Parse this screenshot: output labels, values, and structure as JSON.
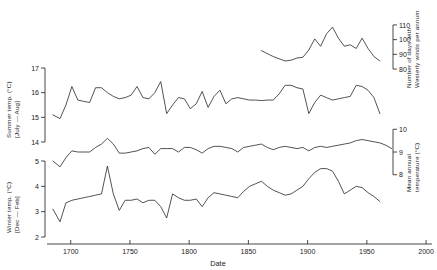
{
  "figure": {
    "background_color": "#ffffff",
    "line_color": "#1a1a1a"
  },
  "x_axis": {
    "title": "Date",
    "ticks": [
      1700,
      1750,
      1800,
      1850,
      1900,
      1950,
      2000
    ],
    "tick_labels": [
      "1700",
      "1750",
      "1800",
      "1850",
      "1900",
      "1950",
      "2000"
    ],
    "range": [
      1680,
      2005
    ]
  },
  "panels": {
    "winds": {
      "title_line1": "Number of days with",
      "title_line2": "Westerly winds per annum",
      "side": "right",
      "ticks": [
        80,
        90,
        100,
        110
      ],
      "tick_labels": [
        "80",
        "90",
        "100",
        "110"
      ],
      "range": [
        78,
        112
      ]
    },
    "summer": {
      "title_line1": "Summer temp. (°C)",
      "title_line2": "[July — Aug]",
      "side": "left",
      "ticks": [
        14,
        15,
        16,
        17
      ],
      "tick_labels": [
        "14",
        "15",
        "16",
        "17"
      ],
      "range": [
        14,
        17
      ]
    },
    "mean_annual": {
      "title_line1": "Mean annual",
      "title_line2": "temperature (°C)",
      "side": "right",
      "ticks": [
        8,
        9,
        10
      ],
      "tick_labels": [
        "8",
        "9",
        "10"
      ],
      "range": [
        7.9,
        10.1
      ]
    },
    "winter": {
      "title_line1": "Winter temp. (°C)",
      "title_line2": "[Dec — Feb]",
      "side": "left",
      "ticks": [
        2,
        3,
        4,
        5
      ],
      "tick_labels": [
        "2",
        "3",
        "4",
        "5"
      ],
      "range": [
        2,
        5
      ]
    }
  },
  "chart_data": {
    "type": "line",
    "title": "",
    "xlabel": "Date",
    "ylabel": "",
    "grid": false,
    "legend": "none",
    "xlim": [
      1680,
      2005
    ],
    "series": [
      {
        "name": "Number of days with Westerly winds per annum",
        "axis": "right-top",
        "ylim": [
          78,
          112
        ],
        "units": "days",
        "x": [
          1861,
          1871,
          1881,
          1886,
          1891,
          1896,
          1901,
          1906,
          1911,
          1916,
          1921,
          1926,
          1931,
          1936,
          1941,
          1946,
          1951,
          1956,
          1961
        ],
        "values": [
          92.5,
          88.5,
          85.5,
          86.0,
          87.5,
          88.0,
          93.0,
          100.5,
          95.5,
          104.0,
          108.5,
          101.0,
          95.5,
          96.5,
          94.0,
          101.0,
          94.0,
          88.5,
          85.5
        ]
      },
      {
        "name": "Summer temp. (July — Aug)",
        "axis": "left-top",
        "ylim": [
          14,
          17
        ],
        "units": "°C",
        "x": [
          1685,
          1691,
          1696,
          1701,
          1706,
          1711,
          1716,
          1721,
          1726,
          1731,
          1736,
          1741,
          1746,
          1751,
          1756,
          1761,
          1766,
          1771,
          1776,
          1781,
          1786,
          1791,
          1796,
          1801,
          1806,
          1811,
          1816,
          1821,
          1826,
          1831,
          1836,
          1841,
          1846,
          1851,
          1856,
          1861,
          1866,
          1871,
          1876,
          1881,
          1886,
          1891,
          1896,
          1901,
          1906,
          1911,
          1916,
          1921,
          1926,
          1931,
          1936,
          1941,
          1946,
          1951,
          1956,
          1961
        ],
        "values": [
          15.1,
          14.95,
          15.5,
          16.25,
          15.7,
          15.65,
          15.6,
          16.2,
          16.2,
          16.0,
          15.85,
          15.75,
          15.8,
          15.9,
          16.25,
          15.8,
          15.75,
          16.0,
          16.45,
          15.15,
          15.5,
          15.8,
          15.75,
          15.35,
          15.55,
          16.05,
          15.4,
          15.85,
          16.1,
          15.55,
          15.75,
          15.8,
          15.75,
          15.7,
          15.7,
          15.68,
          15.7,
          15.7,
          15.95,
          16.3,
          16.3,
          16.2,
          16.15,
          15.15,
          15.6,
          15.9,
          15.8,
          15.7,
          15.75,
          15.8,
          15.85,
          16.3,
          16.25,
          16.1,
          15.8,
          15.15
        ]
      },
      {
        "name": "Mean annual temperature",
        "axis": "right-mid",
        "ylim": [
          7.9,
          10.1
        ],
        "units": "°C",
        "x": [
          1685,
          1691,
          1696,
          1701,
          1706,
          1711,
          1716,
          1721,
          1726,
          1731,
          1736,
          1741,
          1746,
          1751,
          1756,
          1761,
          1766,
          1771,
          1776,
          1781,
          1786,
          1791,
          1796,
          1801,
          1806,
          1811,
          1816,
          1821,
          1826,
          1831,
          1836,
          1841,
          1846,
          1851,
          1856,
          1861,
          1866,
          1871,
          1876,
          1881,
          1886,
          1891,
          1896,
          1901,
          1906,
          1911,
          1916,
          1921,
          1926,
          1931,
          1936,
          1941,
          1946,
          1951,
          1956,
          1961,
          1966,
          1971
        ],
        "values": [
          8.6,
          8.35,
          8.75,
          9.05,
          9.0,
          9.0,
          9.0,
          9.2,
          9.35,
          9.6,
          9.35,
          8.95,
          8.95,
          9.0,
          9.05,
          9.15,
          9.2,
          8.9,
          9.15,
          9.15,
          9.15,
          9.0,
          9.2,
          9.2,
          9.1,
          8.95,
          9.15,
          9.25,
          9.25,
          9.2,
          9.15,
          9.0,
          9.2,
          9.25,
          9.3,
          9.35,
          9.2,
          9.1,
          9.2,
          9.25,
          9.2,
          9.15,
          9.2,
          9.05,
          9.2,
          9.25,
          9.2,
          9.25,
          9.3,
          9.35,
          9.4,
          9.5,
          9.55,
          9.5,
          9.45,
          9.4,
          9.3,
          9.15
        ]
      },
      {
        "name": "Winter temp. (Dec — Feb)",
        "axis": "left-bottom",
        "ylim": [
          2,
          5
        ],
        "units": "°C",
        "x": [
          1685,
          1691,
          1696,
          1701,
          1706,
          1711,
          1716,
          1721,
          1726,
          1731,
          1736,
          1741,
          1746,
          1751,
          1756,
          1761,
          1766,
          1771,
          1776,
          1781,
          1786,
          1791,
          1796,
          1801,
          1806,
          1811,
          1816,
          1821,
          1826,
          1831,
          1836,
          1841,
          1846,
          1851,
          1856,
          1861,
          1866,
          1871,
          1876,
          1881,
          1886,
          1891,
          1896,
          1901,
          1906,
          1911,
          1916,
          1921,
          1926,
          1931,
          1936,
          1941,
          1946,
          1951,
          1956,
          1961
        ],
        "values": [
          3.1,
          2.6,
          3.35,
          3.45,
          3.5,
          3.55,
          3.6,
          3.65,
          3.7,
          4.8,
          3.7,
          3.05,
          3.45,
          3.45,
          3.5,
          3.35,
          3.45,
          3.45,
          3.2,
          2.75,
          3.7,
          3.55,
          3.45,
          3.45,
          3.5,
          3.2,
          3.55,
          3.75,
          3.7,
          3.65,
          3.6,
          3.55,
          3.8,
          4.0,
          4.1,
          4.2,
          4.0,
          3.85,
          3.75,
          3.65,
          3.7,
          3.85,
          4.0,
          4.3,
          4.55,
          4.7,
          4.7,
          4.6,
          4.2,
          3.7,
          3.85,
          4.0,
          3.95,
          3.75,
          3.6,
          3.4
        ]
      }
    ]
  }
}
